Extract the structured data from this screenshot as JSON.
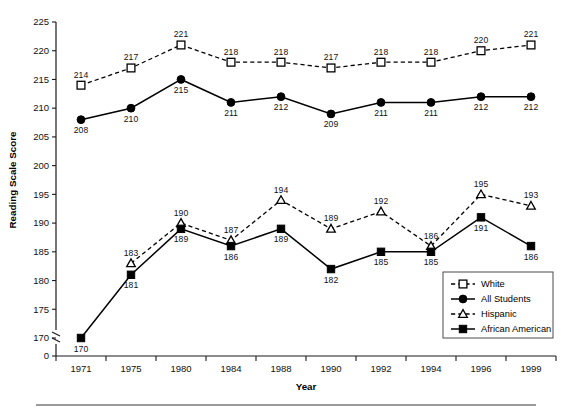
{
  "chart_data": {
    "type": "line",
    "title": "",
    "xlabel": "Year",
    "ylabel": "Reading Scale Score",
    "categories": [
      "1971",
      "1975",
      "1980",
      "1984",
      "1988",
      "1990",
      "1992",
      "1994",
      "1996",
      "1999"
    ],
    "yticks": [
      170,
      175,
      180,
      185,
      190,
      195,
      200,
      205,
      210,
      215,
      220,
      225
    ],
    "ytick_labels": [
      "170",
      "175",
      "180",
      "185",
      "190",
      "195",
      "200",
      "205",
      "210",
      "215",
      "220",
      "225"
    ],
    "y_axis_break": true,
    "y_origin_label": "0",
    "ylim": [
      170,
      225
    ],
    "grid": false,
    "legend_position": "inside-lower-right",
    "series": [
      {
        "name": "White",
        "marker": "open-square",
        "line": "dashed",
        "label_position": "above",
        "values": [
          214,
          217,
          221,
          218,
          218,
          217,
          218,
          218,
          220,
          221
        ]
      },
      {
        "name": "All Students",
        "marker": "filled-circle",
        "line": "solid",
        "label_position": "below",
        "values": [
          208,
          210,
          215,
          211,
          212,
          209,
          211,
          211,
          212,
          212
        ]
      },
      {
        "name": "Hispanic",
        "marker": "open-triangle",
        "line": "dashed",
        "label_position": "above",
        "values": [
          null,
          183,
          190,
          187,
          194,
          189,
          192,
          186,
          195,
          193
        ]
      },
      {
        "name": "African American",
        "marker": "filled-square",
        "line": "solid",
        "label_position": "below",
        "values": [
          170,
          181,
          189,
          186,
          189,
          182,
          185,
          185,
          191,
          186
        ]
      }
    ]
  },
  "colors": {
    "ink": "#000000",
    "axis": "#1a1a1a",
    "legend_border": "#4a4a4a",
    "rule": "#9a9a9a"
  }
}
